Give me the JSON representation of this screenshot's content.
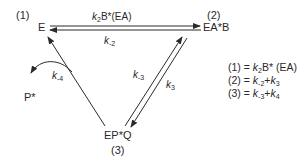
{
  "nodes": {
    "E": {
      "label": "E",
      "index": "(1)"
    },
    "EAB": {
      "label": "EA*B",
      "index": "(2)"
    },
    "EPQ": {
      "label": "EP*Q",
      "index": "(3)"
    },
    "P": {
      "label": "P*"
    }
  },
  "rates": {
    "forward_top": {
      "k": "k",
      "sub": "2",
      "rest": "B*(EA)"
    },
    "reverse_top": {
      "k": "k",
      "sub": "-2"
    },
    "k_minus3": {
      "k": "k",
      "sub": "-3"
    },
    "k3": {
      "k": "k",
      "sub": "3"
    },
    "k_minus4": {
      "k": "k",
      "sub": "-4"
    }
  },
  "equations": [
    {
      "lhs": "(1) = ",
      "k1": "k",
      "s1": "2",
      "rest": "B* (EA)"
    },
    {
      "lhs": "(2) = ",
      "k1": "k",
      "s1": "-2",
      "plus": "+",
      "k2": "k",
      "s2": "3"
    },
    {
      "lhs": "(3) = ",
      "k1": "k",
      "s1": "-3",
      "plus": "+",
      "k2": "k",
      "s2": "4"
    }
  ],
  "colors": {
    "ink": "#2a2a2a",
    "background": "#ffffff"
  }
}
